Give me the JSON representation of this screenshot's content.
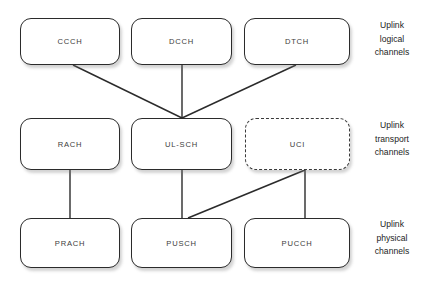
{
  "diagram": {
    "background_color": "#ffffff",
    "stroke_color": "#2b2b2b",
    "rows": [
      {
        "id": "logical",
        "caption": {
          "line1": "Uplink",
          "line2": "logical",
          "line3": "channels"
        },
        "nodes": [
          {
            "id": "ccch",
            "label": "CCCH",
            "border": "solid"
          },
          {
            "id": "dcch",
            "label": "DCCH",
            "border": "solid"
          },
          {
            "id": "dtch",
            "label": "DTCH",
            "border": "solid"
          }
        ]
      },
      {
        "id": "transport",
        "caption": {
          "line1": "Uplink",
          "line2": "transport",
          "line3": "channels"
        },
        "nodes": [
          {
            "id": "rach",
            "label": "RACH",
            "border": "solid"
          },
          {
            "id": "ulsch",
            "label": "UL-SCH",
            "border": "solid"
          },
          {
            "id": "uci",
            "label": "UCI",
            "border": "dashed"
          }
        ]
      },
      {
        "id": "physical",
        "caption": {
          "line1": "Uplink",
          "line2": "physical",
          "line3": "channels"
        },
        "nodes": [
          {
            "id": "prach",
            "label": "PRACH",
            "border": "solid"
          },
          {
            "id": "pusch",
            "label": "PUSCH",
            "border": "solid"
          },
          {
            "id": "pucch",
            "label": "PUCCH",
            "border": "solid"
          }
        ]
      }
    ],
    "connections": [
      {
        "from": "ccch",
        "to": "ulsch"
      },
      {
        "from": "dcch",
        "to": "ulsch"
      },
      {
        "from": "dtch",
        "to": "ulsch"
      },
      {
        "from": "rach",
        "to": "prach"
      },
      {
        "from": "ulsch",
        "to": "pusch"
      },
      {
        "from": "uci",
        "to": "pusch"
      },
      {
        "from": "uci",
        "to": "pucch"
      }
    ]
  }
}
